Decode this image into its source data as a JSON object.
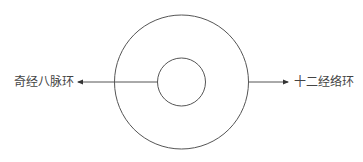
{
  "diagram": {
    "labels": {
      "left": "奇经八脉环",
      "right": "十二经络环"
    },
    "outer_circle": {
      "cx": 181.5,
      "cy": 82,
      "r": 67
    },
    "inner_circle": {
      "cx": 181.5,
      "cy": 82,
      "r": 24
    },
    "arrows": [
      {
        "name": "arrow-to-left-label",
        "from": [
          157.5,
          82
        ],
        "to": [
          76,
          82
        ]
      },
      {
        "name": "arrow-to-right-label",
        "from": [
          248.5,
          82
        ],
        "to": [
          290,
          82
        ]
      }
    ],
    "colors": {
      "stroke": "#555555",
      "text": "#444444",
      "background": "#ffffff"
    }
  }
}
